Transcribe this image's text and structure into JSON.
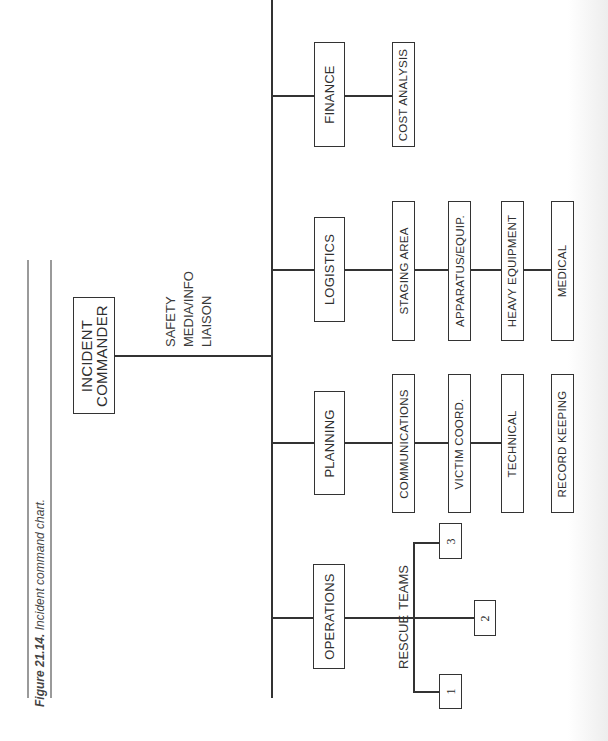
{
  "caption": {
    "figure_label": "Figure 21.14.",
    "text": "Incident command chart."
  },
  "commander": {
    "label_line1": "INCIDENT",
    "label_line2": "COMMANDER"
  },
  "command_staff": [
    "SAFETY",
    "MEDIA/INFO",
    "LIAISON"
  ],
  "sections": {
    "operations": {
      "label": "OPERATIONS",
      "group_label_1": "RESCUE",
      "group_label_2": "TEAMS",
      "teams": [
        "1",
        "2",
        "3"
      ]
    },
    "planning": {
      "label": "PLANNING",
      "units": [
        "COMMUNICATIONS",
        "VICTIM COORD.",
        "TECHNICAL",
        "RECORD KEEPING"
      ]
    },
    "logistics": {
      "label": "LOGISTICS",
      "units": [
        "STAGING AREA",
        "APPARATUS/EQUIP.",
        "HEAVY EQUIPMENT",
        "MEDICAL"
      ]
    },
    "finance": {
      "label": "FINANCE",
      "units": [
        "COST ANALYSIS"
      ]
    }
  }
}
